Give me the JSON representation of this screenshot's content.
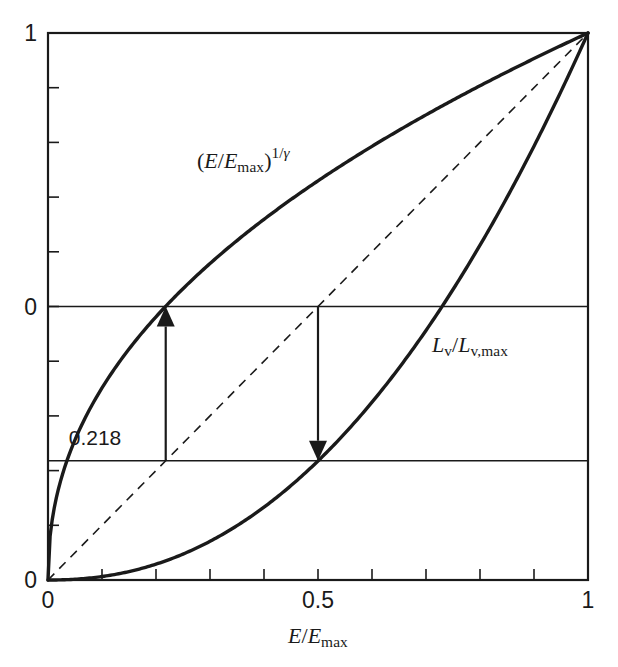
{
  "figure": {
    "background_color": "#ffffff",
    "ink_color": "#1a1a1a",
    "frame": {
      "left": 48,
      "top": 33,
      "right": 588,
      "bottom": 580
    }
  },
  "axes": {
    "x": {
      "title_parts": {
        "var": "E",
        "slash": "/",
        "var2": "E",
        "sub2": "max"
      },
      "title_text": "E/Emax",
      "ticks": [
        {
          "value": 0,
          "label": "0"
        },
        {
          "value": 0.1,
          "label": ""
        },
        {
          "value": 0.2,
          "label": ""
        },
        {
          "value": 0.3,
          "label": ""
        },
        {
          "value": 0.4,
          "label": ""
        },
        {
          "value": 0.5,
          "label": "0.5"
        },
        {
          "value": 0.6,
          "label": ""
        },
        {
          "value": 0.7,
          "label": ""
        },
        {
          "value": 0.8,
          "label": ""
        },
        {
          "value": 0.9,
          "label": ""
        },
        {
          "value": 1.0,
          "label": "1"
        }
      ],
      "range": [
        0,
        1
      ]
    },
    "y": {
      "title_text": "",
      "ticks": [
        {
          "value": 0,
          "label": "0"
        },
        {
          "value": 0.1,
          "label": ""
        },
        {
          "value": 0.2,
          "label": ""
        },
        {
          "value": 0.3,
          "label": ""
        },
        {
          "value": 0.4,
          "label": ""
        },
        {
          "value": 0.5,
          "label": "0"
        },
        {
          "value": 0.6,
          "label": ""
        },
        {
          "value": 0.7,
          "label": ""
        },
        {
          "value": 0.8,
          "label": ""
        },
        {
          "value": 0.9,
          "label": ""
        },
        {
          "value": 1.0,
          "label": "1"
        }
      ],
      "range": [
        0,
        1
      ]
    }
  },
  "curve_labels": {
    "upper": {
      "text": "(E/Emax)^(1/gamma)",
      "parts": {
        "var": "E",
        "slash": "/",
        "var2": "E",
        "sub2": "max",
        "exp": "1/",
        "exp_sym": "γ"
      },
      "x": 197,
      "y": 160
    },
    "lower": {
      "text": "Lv/Lv,max",
      "parts": {
        "var": "L",
        "sub": "v",
        "slash": "/",
        "var2": "L",
        "sub2": "v,max"
      },
      "x": 432,
      "y": 346
    }
  },
  "annotations": [
    {
      "name": "gamma-offset-value",
      "label": "0.218",
      "x": 95,
      "y": 437
    }
  ],
  "arrows": [
    {
      "name": "up-arrow",
      "direction": "up",
      "x_data": 0.218,
      "y_from": 0.218,
      "y_to": 0.5
    },
    {
      "name": "down-arrow",
      "direction": "down",
      "x_data": 0.5,
      "y_from": 0.5,
      "y_to": 0.218
    }
  ],
  "reference_lines": [
    {
      "name": "half-level-line",
      "y_data": 0.5,
      "x_from": 0.0,
      "x_to": 1.0
    },
    {
      "name": "gamma-level-line",
      "y_data": 0.218,
      "x_from": 0.0,
      "x_to": 1.0
    }
  ],
  "chart_data": {
    "type": "line",
    "title": "",
    "subtitle": "",
    "xlabel": "E/Emax",
    "ylabel": "",
    "xlim": [
      0,
      1
    ],
    "ylim": [
      0,
      1
    ],
    "grid": false,
    "legend": "inline-curve-labels",
    "xticks": [
      0,
      0.5,
      1
    ],
    "xticklabels": [
      "0",
      "0.5",
      "1"
    ],
    "yticks": [
      0,
      0.5,
      1
    ],
    "yticklabels": [
      "0",
      "0",
      "1"
    ],
    "xminorticks": [
      0.1,
      0.2,
      0.3,
      0.4,
      0.6,
      0.7,
      0.8,
      0.9
    ],
    "yminorticks": [
      0.1,
      0.2,
      0.3,
      0.4,
      0.6,
      0.7,
      0.8,
      0.9
    ],
    "gamma": 2.2,
    "series": [
      {
        "name": "(E/Emax)^(1/gamma)",
        "style": "solid-thick",
        "exponent": 0.4545,
        "x": [
          0,
          0.01,
          0.02,
          0.04,
          0.06,
          0.08,
          0.1,
          0.15,
          0.2,
          0.218,
          0.25,
          0.3,
          0.35,
          0.4,
          0.45,
          0.5,
          0.55,
          0.6,
          0.65,
          0.7,
          0.75,
          0.8,
          0.85,
          0.9,
          0.95,
          1
        ],
        "y": [
          0,
          0.1151,
          0.1578,
          0.2163,
          0.2603,
          0.2965,
          0.3277,
          0.3917,
          0.4492,
          0.4668,
          0.4961,
          0.5372,
          0.5752,
          0.6105,
          0.6436,
          0.6749,
          0.7046,
          0.7329,
          0.76,
          0.786,
          0.811,
          0.8351,
          0.8585,
          0.8811,
          0.9031,
          1.0
        ]
      },
      {
        "name": "Lv/Lv,max",
        "style": "solid-thick",
        "exponent": 2.2,
        "x": [
          0,
          0.05,
          0.1,
          0.15,
          0.2,
          0.25,
          0.3,
          0.35,
          0.4,
          0.45,
          0.5,
          0.55,
          0.6,
          0.65,
          0.7,
          0.75,
          0.8,
          0.85,
          0.9,
          0.95,
          1
        ],
        "y": [
          0,
          0.0017,
          0.0063,
          0.0134,
          0.0229,
          0.0347,
          0.0488,
          0.0651,
          0.0836,
          0.1043,
          0.1272,
          0.1522,
          0.1794,
          0.2087,
          0.2402,
          0.2738,
          0.3095,
          0.3474,
          0.3874,
          0.4295,
          1.0
        ]
      },
      {
        "name": "identity-diagonal",
        "style": "dashed-thin",
        "x": [
          0,
          1
        ],
        "y": [
          0,
          1
        ]
      }
    ],
    "marked_points": [
      {
        "label": "0.218",
        "x": 0.218,
        "y": 0.5,
        "note": "upper curve crosses 0.5 level"
      },
      {
        "label": "0.218",
        "x": 0.5,
        "y": 0.218,
        "note": "lower curve crosses at x=0.5"
      }
    ]
  }
}
